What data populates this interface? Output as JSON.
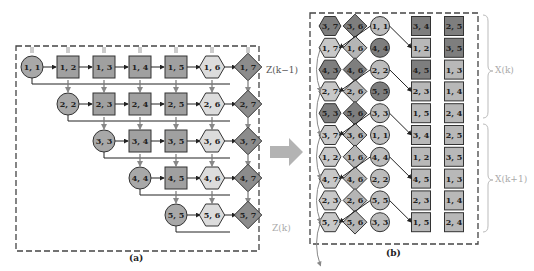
{
  "panel_a": {
    "caption": "(a)",
    "rows": [
      [
        {
          "t": "circle",
          "l": "1, 1"
        },
        {
          "t": "square",
          "l": "1, 2"
        },
        {
          "t": "square",
          "l": "1, 3"
        },
        {
          "t": "square",
          "l": "1, 4"
        },
        {
          "t": "square",
          "l": "1, 5"
        },
        {
          "t": "hex",
          "l": "1, 6"
        },
        {
          "t": "diamond",
          "l": "1, 7"
        }
      ],
      [
        {
          "t": "circle",
          "l": "2, 2"
        },
        {
          "t": "square",
          "l": "2, 3"
        },
        {
          "t": "square",
          "l": "2, 4"
        },
        {
          "t": "square",
          "l": "2, 5"
        },
        {
          "t": "hex",
          "l": "2, 6"
        },
        {
          "t": "diamond",
          "l": "2, 7"
        }
      ],
      [
        {
          "t": "circle",
          "l": "3, 3"
        },
        {
          "t": "square",
          "l": "3, 4"
        },
        {
          "t": "square",
          "l": "3, 5"
        },
        {
          "t": "hex",
          "l": "3, 6"
        },
        {
          "t": "diamond",
          "l": "3, 7"
        }
      ],
      [
        {
          "t": "circle",
          "l": "4, 4"
        },
        {
          "t": "square",
          "l": "4, 5"
        },
        {
          "t": "hex",
          "l": "4, 6"
        },
        {
          "t": "diamond",
          "l": "4, 7"
        }
      ],
      [
        {
          "t": "circle",
          "l": "5, 5"
        },
        {
          "t": "hex",
          "l": "5, 6"
        },
        {
          "t": "diamond",
          "l": "5, 7"
        }
      ]
    ]
  },
  "middle": {
    "label_top": "Z(k−1)",
    "label_bottom": "Z(k)"
  },
  "panel_b": {
    "caption": "(b)",
    "label_xk": "X(k)",
    "label_xk1": "X(k+1)",
    "columns": [
      {
        "shape": "hex",
        "labels": [
          "3, 7",
          "1, 7",
          "4, 3",
          "2, 7",
          "5, 3",
          "3, 7",
          "1, 2",
          "4, 7",
          "2, 3",
          "5, 7"
        ],
        "dark": [
          true,
          false,
          true,
          false,
          true,
          false,
          false,
          false,
          false,
          false
        ]
      },
      {
        "shape": "diamond",
        "labels": [
          "3, 6",
          "1, 6",
          "4, 6",
          "2, 6",
          "5, 6",
          "3, 6",
          "1, 6",
          "4, 6",
          "2, 6",
          "5, 6"
        ],
        "dark": [
          true,
          false,
          true,
          false,
          true,
          false,
          false,
          false,
          false,
          false
        ]
      },
      {
        "shape": "circle",
        "labels": [
          "1, 1",
          "4, 4",
          "2, 2",
          "5, 5",
          "3, 3",
          "1, 1",
          "4, 4",
          "2, 2",
          "5, 5",
          "3, 3"
        ],
        "dark": [
          false,
          true,
          false,
          true,
          false,
          false,
          false,
          false,
          false,
          false
        ]
      },
      {
        "shape": "square",
        "labels": [
          "3, 4",
          "1, 2",
          "4, 5",
          "2, 3",
          "1, 5",
          "3, 4",
          "1, 2",
          "4, 5",
          "2, 3",
          "1, 5"
        ],
        "dark": [
          true,
          false,
          true,
          false,
          false,
          false,
          false,
          false,
          false,
          false
        ]
      },
      {
        "shape": "square",
        "labels": [
          "2, 5",
          "3, 5",
          "1, 3",
          "1, 4",
          "2, 4",
          "2, 5",
          "3, 5",
          "1, 3",
          "1, 4",
          "2, 4"
        ],
        "dark": [
          true,
          true,
          false,
          false,
          false,
          false,
          false,
          false,
          false,
          false
        ]
      }
    ]
  },
  "colors": {
    "circle": "#a8a8a8",
    "square": "#a0a0a0",
    "hex": "#dcdcdc",
    "diamond": "#8c8c8c",
    "dark": "#7e7e7e",
    "light": "#bdbdbd",
    "stroke": "#333333",
    "arrow_gray": "#999999",
    "faint": "#cccccc"
  }
}
